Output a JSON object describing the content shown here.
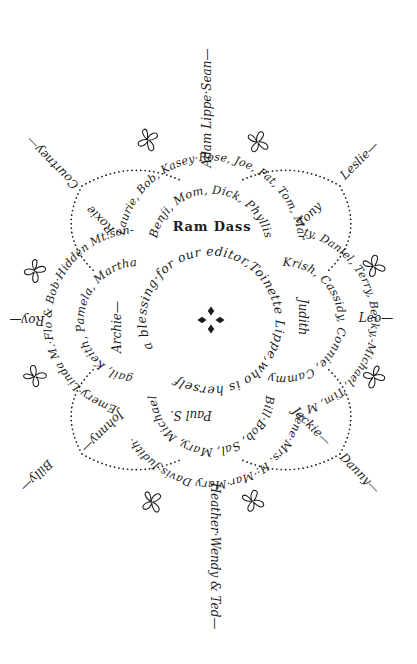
{
  "artwork": {
    "ink_color": "#1c1c1c",
    "background_color": "#ffffff",
    "center_motto": "a blessing·for our editor,Toinette Lippe,who is herself",
    "outer_ring": {
      "top": "Laurie, Bob, Kasey·Rose, Joe, Pat, Tom, Mar-",
      "right": "ty, Daniel, Terry, Becky,-Michael, Tim, Mar-",
      "bottom": "lene·Mrs. H:·Mar·Mary Davis·Judith·",
      "left": "Emery·Linda M.·Flo & Bob·Hidden Mt:son-"
    },
    "lobes": {
      "top": {
        "names": "Benji, Mom, Dick, Phyllis",
        "center_name": "Ram Dass"
      },
      "right": {
        "names": "Krish, Cassidy, Connie, Cammy",
        "center_name": "Judith"
      },
      "bottom": {
        "names": "Bill·Bob, Sal, Mary, Michael",
        "center_name": "Paul S."
      },
      "left": {
        "names": "gail, Keith, Pamela, Martha",
        "center_name": "Archie—"
      }
    },
    "petals": {
      "nw": "Roxie",
      "ne": "Tony",
      "se": "Jackie—",
      "sw": "Johnny—"
    },
    "spokes": {
      "n": "Adam Lippe·Sean—",
      "ne": "Leslie—",
      "e": "Leo—",
      "se": "Danny—",
      "s": "Heather·Wendy & Ted—",
      "sw": "Billy—",
      "w": "Roy—",
      "nw": "Courtney—"
    }
  }
}
